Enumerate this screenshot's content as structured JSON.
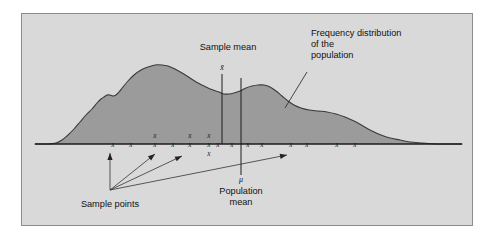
{
  "figure": {
    "name": "frequency-distribution-of-population-diagram",
    "frame": {
      "x": 21,
      "y": 13,
      "width": 452,
      "height": 213
    },
    "colors": {
      "page_background": "#ffffff",
      "panel_background": "#d9d9d9",
      "panel_border": "#8c8c8c",
      "curve_fill": "#9b9b9b",
      "curve_stroke": "#3a3a3a",
      "axis_line": "#1c1c1c",
      "text": "#111111",
      "leader_line": "#333333"
    }
  },
  "labels": {
    "sample_mean": {
      "text": "Sample mean",
      "x": 228,
      "y": 50,
      "anchor": "middle"
    },
    "sample_mean_symbol": {
      "text": "x̄",
      "x": 222,
      "y": 70,
      "anchor": "middle"
    },
    "frequency_distribution": {
      "lines": [
        "Frequency distribution",
        "of the",
        "population"
      ],
      "x": 311,
      "y": 36,
      "line_height": 11,
      "anchor": "start"
    },
    "population_mean_symbol": {
      "text": "μ",
      "x": 241,
      "y": 182,
      "anchor": "middle"
    },
    "population_mean": {
      "lines": [
        "Population",
        "mean"
      ],
      "x": 241,
      "y": 194,
      "line_height": 11,
      "anchor": "middle"
    },
    "sample_points": {
      "text": "Sample points",
      "x": 110,
      "y": 207,
      "anchor": "middle"
    }
  },
  "axis": {
    "y": 144,
    "x_start": 35,
    "x_end": 462
  },
  "vertical_lines": [
    {
      "name": "sample-mean-line",
      "x": 222,
      "y_top": 74,
      "y_bottom": 144
    },
    {
      "name": "population-mean-line",
      "x": 241,
      "y_top": 78,
      "y_bottom": 175
    }
  ],
  "sample_points_marks": [
    {
      "x": 113,
      "y": 144
    },
    {
      "x": 131,
      "y": 144
    },
    {
      "x": 155,
      "y": 144
    },
    {
      "x": 155,
      "y": 135
    },
    {
      "x": 173,
      "y": 144
    },
    {
      "x": 190,
      "y": 144
    },
    {
      "x": 190,
      "y": 135
    },
    {
      "x": 209,
      "y": 144
    },
    {
      "x": 209,
      "y": 135
    },
    {
      "x": 209,
      "y": 153
    },
    {
      "x": 218,
      "y": 144
    },
    {
      "x": 232,
      "y": 144
    },
    {
      "x": 248,
      "y": 144
    },
    {
      "x": 262,
      "y": 144
    },
    {
      "x": 291,
      "y": 144
    },
    {
      "x": 307,
      "y": 144
    },
    {
      "x": 337,
      "y": 144
    },
    {
      "x": 355,
      "y": 144
    }
  ],
  "arrows": {
    "origin": {
      "x": 110,
      "y": 190
    },
    "targets": [
      {
        "name": "arrow-to-first-sample-point",
        "x": 110,
        "y": 153
      },
      {
        "name": "arrow-to-cluster-left",
        "x": 155,
        "y": 154
      },
      {
        "name": "arrow-to-cluster-mid",
        "x": 182,
        "y": 156
      },
      {
        "name": "arrow-to-cluster-right",
        "x": 287,
        "y": 155
      }
    ]
  },
  "leader_line": {
    "name": "frequency-distribution-leader",
    "from": {
      "x": 307,
      "y": 72
    },
    "to": {
      "x": 285,
      "y": 108
    }
  },
  "chart_data": {
    "type": "area",
    "xlabel": "",
    "ylabel": "Frequency",
    "grid": false,
    "legend": "none",
    "annotations": [
      "Sample mean",
      "Frequency distribution of the population",
      "Population mean",
      "Sample points"
    ],
    "baseline_y": 144,
    "curve_points": [
      [
        35,
        144
      ],
      [
        48,
        144
      ],
      [
        56,
        143
      ],
      [
        62,
        140
      ],
      [
        68,
        135
      ],
      [
        74,
        129
      ],
      [
        80,
        122
      ],
      [
        86,
        115
      ],
      [
        92,
        109
      ],
      [
        97,
        103
      ],
      [
        101,
        99
      ],
      [
        104,
        97
      ],
      [
        107,
        95
      ],
      [
        110,
        95
      ],
      [
        113,
        96
      ],
      [
        116,
        95
      ],
      [
        119,
        92
      ],
      [
        123,
        87
      ],
      [
        128,
        81
      ],
      [
        134,
        75
      ],
      [
        141,
        70
      ],
      [
        148,
        67
      ],
      [
        155,
        65
      ],
      [
        162,
        65
      ],
      [
        168,
        66
      ],
      [
        175,
        69
      ],
      [
        182,
        73
      ],
      [
        190,
        78
      ],
      [
        198,
        83
      ],
      [
        206,
        87
      ],
      [
        213,
        90
      ],
      [
        219,
        92
      ],
      [
        224,
        94
      ],
      [
        229,
        94
      ],
      [
        234,
        93
      ],
      [
        240,
        91
      ],
      [
        246,
        88
      ],
      [
        252,
        86
      ],
      [
        258,
        85
      ],
      [
        264,
        85
      ],
      [
        270,
        87
      ],
      [
        276,
        91
      ],
      [
        282,
        96
      ],
      [
        288,
        101
      ],
      [
        294,
        105
      ],
      [
        301,
        108
      ],
      [
        309,
        110
      ],
      [
        318,
        111
      ],
      [
        327,
        112
      ],
      [
        336,
        114
      ],
      [
        345,
        117
      ],
      [
        354,
        121
      ],
      [
        363,
        126
      ],
      [
        372,
        131
      ],
      [
        381,
        135
      ],
      [
        390,
        138
      ],
      [
        400,
        140
      ],
      [
        410,
        142
      ],
      [
        422,
        143
      ],
      [
        436,
        144
      ],
      [
        450,
        144
      ],
      [
        462,
        144
      ]
    ]
  }
}
